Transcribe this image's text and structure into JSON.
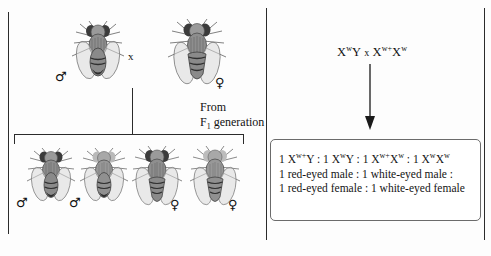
{
  "figure": {
    "cross_symbol": "x",
    "accent_color": "#2b2b2b",
    "box_border_color": "#6b6b6b"
  },
  "parents": {
    "male": {
      "sex_symbol": "♂",
      "sex_name": "male",
      "icon": "fly-icon"
    },
    "cross_symbol": "x",
    "female": {
      "sex_symbol": "♀",
      "sex_name": "female",
      "icon": "fly-icon"
    }
  },
  "caption": {
    "line1": "From",
    "line2_prefix": "F",
    "line2_sub": "1",
    "line2_suffix": " generation"
  },
  "offspring": [
    {
      "sex_symbol": "♂",
      "sex_name": "male",
      "icon": "fly-icon"
    },
    {
      "sex_symbol": "♂",
      "sex_name": "male",
      "icon": "fly-icon"
    },
    {
      "sex_symbol": "♀",
      "sex_name": "female",
      "icon": "fly-icon"
    },
    {
      "sex_symbol": "♀",
      "sex_name": "female",
      "icon": "fly-icon"
    }
  ],
  "genotype_cross": {
    "male_parent": {
      "base1": "X",
      "sup1": "w",
      "base2": "Y"
    },
    "operator": "x",
    "female_parent": {
      "base1": "X",
      "sup1": "w+",
      "base2": "X",
      "sup2": "w"
    }
  },
  "arrow": {
    "name": "down-arrow-icon",
    "direction": "down"
  },
  "results": {
    "ratio_line": {
      "terms": [
        {
          "count": "1 ",
          "base1": "X",
          "sup1": "w+",
          "base2": "Y"
        },
        {
          "count": "1 ",
          "base1": "X",
          "sup1": "w",
          "base2": "Y"
        },
        {
          "count": "1 ",
          "base1": "X",
          "sup1": "w+",
          "base2": "X",
          "sup2": "w"
        },
        {
          "count": "1 ",
          "base1": "X",
          "sup1": "w",
          "base2": "X",
          "sup2": "w"
        }
      ],
      "separator": " : "
    },
    "phenotype_line_1": "1 red-eyed male : 1 white-eyed male :",
    "phenotype_line_2": "1 red-eyed female : 1 white-eyed female"
  }
}
